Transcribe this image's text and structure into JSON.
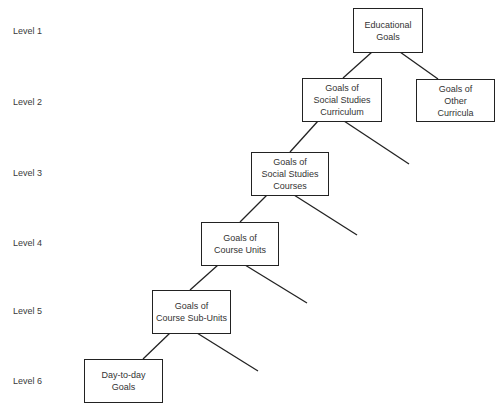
{
  "levels": [
    {
      "label": "Level 1"
    },
    {
      "label": "Level 2"
    },
    {
      "label": "Level 3"
    },
    {
      "label": "Level 4"
    },
    {
      "label": "Level 5"
    },
    {
      "label": "Level 6"
    }
  ],
  "nodes": {
    "educational_goals": {
      "lines": [
        "Educational",
        "Goals"
      ]
    },
    "social_studies_curriculum": {
      "lines": [
        "Goals of",
        "Social Studies",
        "Curriculum"
      ]
    },
    "other_curricula": {
      "lines": [
        "Goals of",
        "Other",
        "Curricula"
      ]
    },
    "social_studies_courses": {
      "lines": [
        "Goals of",
        "Social Studies",
        "Courses"
      ]
    },
    "course_units": {
      "lines": [
        "Goals of",
        "Course Units"
      ]
    },
    "course_sub_units": {
      "lines": [
        "Goals of",
        "Course Sub-Units"
      ]
    },
    "day_to_day": {
      "lines": [
        "Day-to-day",
        "Goals"
      ]
    }
  },
  "edges": [
    {
      "from": "Educational Goals",
      "to": "Goals of Social Studies Curriculum"
    },
    {
      "from": "Educational Goals",
      "to": "Goals of Other Curricula"
    },
    {
      "from": "Goals of Social Studies Curriculum",
      "to": "Goals of Social Studies Courses"
    },
    {
      "from": "Goals of Social Studies Courses",
      "to": "Goals of Course Units"
    },
    {
      "from": "Goals of Course Units",
      "to": "Goals of Course Sub-Units"
    },
    {
      "from": "Goals of Course Sub-Units",
      "to": "Day-to-day Goals"
    }
  ]
}
